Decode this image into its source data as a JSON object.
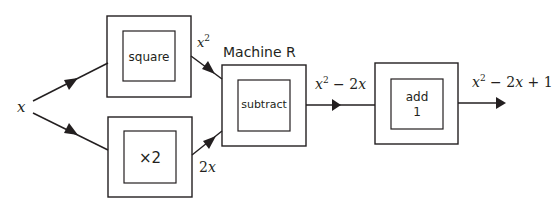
{
  "input": {
    "label": "x"
  },
  "machines": [
    {
      "id": "square",
      "label": "square"
    },
    {
      "id": "times2",
      "label": "×2"
    },
    {
      "id": "subtract",
      "label": "subtract",
      "title": "Machine R"
    },
    {
      "id": "add1",
      "label_line1": "add",
      "label_line2": "1"
    }
  ],
  "edge_labels": {
    "square_out": {
      "base": "x",
      "sup": "2"
    },
    "times2_out": {
      "coef": "2",
      "var": "x"
    },
    "subtract_out": {
      "base": "x",
      "sup": "2",
      "rest_op": " − 2",
      "rest_var": "x"
    },
    "final_out": {
      "base": "x",
      "sup": "2",
      "rest_op": " − 2",
      "rest_var": "x",
      "tail": " + 1"
    }
  },
  "colors": {
    "stroke": "#231f20",
    "background": "#ffffff"
  }
}
